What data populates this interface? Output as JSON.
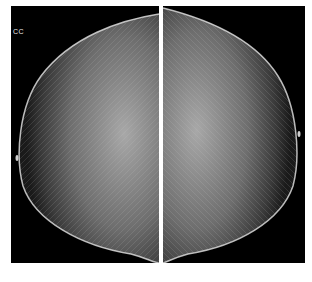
{
  "image": {
    "type": "mammogram",
    "view_label": "CC",
    "panels": [
      {
        "side": "left",
        "description": "craniocaudal view, breast tissue extending left"
      },
      {
        "side": "right",
        "description": "craniocaudal view, breast tissue extending right"
      }
    ],
    "colors": {
      "background": "#000000",
      "tissue": "#bdbdbd",
      "page": "#ffffff"
    }
  }
}
